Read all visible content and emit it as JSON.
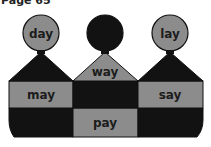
{
  "header": {
    "page_label": "Page 65"
  },
  "colors": {
    "light": "#8c8c8c",
    "dark": "#121212",
    "text": "#1c1c1c",
    "outline": "#111111"
  },
  "puzzle": {
    "heads": [
      {
        "word": "day",
        "shade": "light"
      },
      {
        "word": "",
        "shade": "dark",
        "note": "text present but unreadable (dark on dark)"
      },
      {
        "word": "lay",
        "shade": "light"
      }
    ],
    "rows": [
      [
        {
          "word": "",
          "shade": "dark",
          "note": "unreadable"
        },
        {
          "word": "way",
          "shade": "light"
        },
        {
          "word": "",
          "shade": "dark",
          "note": "unreadable"
        }
      ],
      [
        {
          "word": "may",
          "shade": "light"
        },
        {
          "word": "",
          "shade": "dark",
          "note": "unreadable"
        },
        {
          "word": "say",
          "shade": "light"
        }
      ],
      [
        {
          "word": "",
          "shade": "dark",
          "note": "unreadable"
        },
        {
          "word": "pay",
          "shade": "light"
        },
        {
          "word": "",
          "shade": "dark",
          "note": "unreadable"
        }
      ]
    ]
  }
}
